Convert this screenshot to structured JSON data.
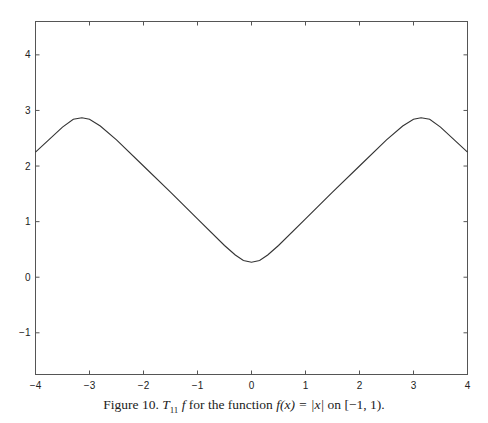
{
  "header": {
    "page_number": "106",
    "running_head": "FOURIER SERIES"
  },
  "caption": {
    "prefix": "Figure 10.",
    "operator": "T",
    "subscript": "11",
    "func": "f",
    "middle": "for the function",
    "formula": "f(x) = |x|",
    "suffix": "on [−1, 1)."
  },
  "chart_data": {
    "type": "line",
    "title": "",
    "xlabel": "",
    "ylabel": "",
    "xlim": [
      -4,
      4
    ],
    "ylim": [
      -1.75,
      4.6
    ],
    "grid": false,
    "legend": null,
    "x_ticks": [
      -4,
      -3,
      -2,
      -1,
      0,
      1,
      2,
      3,
      4
    ],
    "y_ticks": [
      -1,
      0,
      1,
      2,
      3,
      4
    ],
    "x_tick_labels": [
      "−4",
      "−3",
      "−2",
      "−1",
      "0",
      "1",
      "2",
      "3",
      "4"
    ],
    "y_tick_labels": [
      "−1",
      "0",
      "1",
      "2",
      "3",
      "4"
    ],
    "series": [
      {
        "name": "T11 f",
        "x": [
          -4,
          -3.5,
          -3.3,
          -3.14,
          -3.0,
          -2.8,
          -2.5,
          -2.0,
          -1.5,
          -1.0,
          -0.5,
          -0.3,
          -0.15,
          0,
          0.15,
          0.3,
          0.5,
          1.0,
          1.5,
          2.0,
          2.5,
          2.8,
          3.0,
          3.14,
          3.3,
          3.5,
          4
        ],
        "y": [
          2.25,
          2.7,
          2.84,
          2.87,
          2.84,
          2.72,
          2.47,
          2.0,
          1.53,
          1.05,
          0.57,
          0.4,
          0.3,
          0.27,
          0.3,
          0.4,
          0.57,
          1.05,
          1.53,
          2.0,
          2.47,
          2.72,
          2.84,
          2.87,
          2.84,
          2.7,
          2.25
        ]
      }
    ],
    "line_color": "#333333"
  }
}
